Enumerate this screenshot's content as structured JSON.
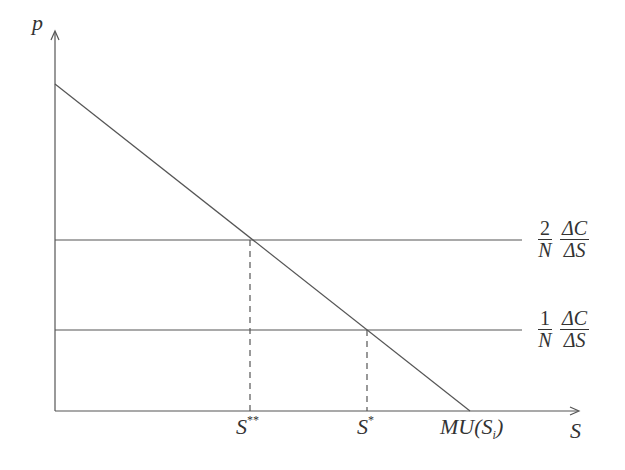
{
  "axes": {
    "y_label": "p",
    "x_label": "S"
  },
  "curves": {
    "demand_label": "MU(S_i)",
    "demand_label_main": "MU(S",
    "demand_label_sub": "i",
    "demand_label_close": ")"
  },
  "levels": [
    {
      "coef_num": "2",
      "coef_den": "N",
      "frac_num": "ΔC",
      "frac_den": "ΔS"
    },
    {
      "coef_num": "1",
      "coef_den": "N",
      "frac_num": "ΔC",
      "frac_den": "ΔS"
    }
  ],
  "ticks": {
    "s_double_star": {
      "base": "S",
      "sup": "**"
    },
    "s_star": {
      "base": "S",
      "sup": "*"
    }
  },
  "colors": {
    "line": "#555555",
    "text": "#333333"
  }
}
